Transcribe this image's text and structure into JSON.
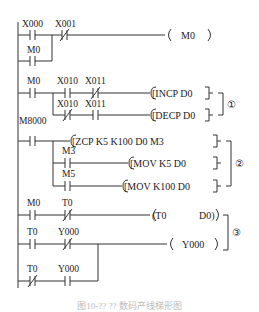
{
  "diagram": {
    "type": "ladder-diagram",
    "rungs": [
      {
        "contacts": [
          {
            "name": "X000",
            "type": "NO"
          },
          {
            "name": "X001",
            "type": "NC"
          }
        ],
        "parallel": [
          {
            "name": "M0",
            "type": "NO"
          }
        ],
        "output": {
          "kind": "coil",
          "text": "M0"
        }
      },
      {
        "contacts": [
          {
            "name": "M0",
            "type": "NO"
          },
          {
            "name": "X010",
            "type": "NO"
          },
          {
            "name": "X011",
            "type": "NC"
          }
        ],
        "output": {
          "kind": "instruction",
          "op": "INCP",
          "args": "D0"
        }
      },
      {
        "contacts": [
          {
            "name": "X010",
            "type": "NC"
          },
          {
            "name": "X011",
            "type": "NO"
          }
        ],
        "output": {
          "kind": "instruction",
          "op": "DECP",
          "args": "D0"
        }
      },
      {
        "contacts": [
          {
            "name": "M8000",
            "type": "NO"
          }
        ],
        "output": {
          "kind": "instruction",
          "op": "ZCP",
          "args": "K5  K100  D0  M3"
        }
      },
      {
        "contacts": [
          {
            "name": "M3",
            "type": "NO"
          }
        ],
        "output": {
          "kind": "instruction",
          "op": "MOV",
          "args": "K5  D0"
        }
      },
      {
        "contacts": [
          {
            "name": "M5",
            "type": "NO"
          }
        ],
        "output": {
          "kind": "instruction",
          "op": "MOV",
          "args": "K100  D0"
        }
      },
      {
        "contacts": [
          {
            "name": "M0",
            "type": "NO"
          },
          {
            "name": "T0",
            "type": "NC"
          }
        ],
        "output": {
          "kind": "timer",
          "text": "T0",
          "preset": "D0"
        }
      },
      {
        "contacts": [
          {
            "name": "T0",
            "type": "NO"
          },
          {
            "name": "Y000",
            "type": "NC"
          }
        ],
        "output": {
          "kind": "coil",
          "text": "Y000"
        }
      },
      {
        "contacts": [
          {
            "name": "T0",
            "type": "NC"
          },
          {
            "name": "Y000",
            "type": "NO"
          }
        ],
        "parallel_to_previous": true
      }
    ],
    "labels": {
      "x000": "X000",
      "x001": "X001",
      "m0a": "M0",
      "m0b": "M0",
      "x010a": "X010",
      "x011a": "X011",
      "x010b": "X010",
      "x011b": "X011",
      "m8000": "M8000",
      "m3": "M3",
      "m5": "M5",
      "m0c": "M0",
      "t0a": "T0",
      "t0b": "T0",
      "y000a": "Y000",
      "t0c": "T0",
      "y000b": "Y000"
    },
    "outputs": {
      "coil_m0": "M0",
      "incp": "[INCP   D0",
      "decp": "[DECP   D0",
      "zcp": "[ZCP  K5   K100   D0   M3",
      "mov1": "[MOV    K5    D0",
      "mov2": "[MOV   K100    D0",
      "timer": "(T0",
      "timer_preset": "D0)",
      "coil_y000": "Y000"
    },
    "group_markers": [
      "①",
      "②",
      "③"
    ],
    "caption": "图10-?? ?? 数码产线梯形图"
  }
}
